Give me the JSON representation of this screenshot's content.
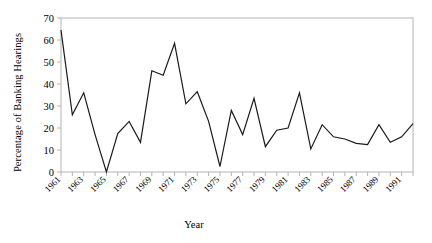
{
  "chart_data": {
    "type": "line",
    "title": "",
    "xlabel": "Year",
    "ylabel": "Percentage of Banking Hearings",
    "xlim": [
      1961,
      1992
    ],
    "ylim": [
      0,
      70
    ],
    "ytick_values": [
      0,
      10,
      20,
      30,
      40,
      50,
      60,
      70
    ],
    "ytick_labels": [
      "0",
      "10",
      "20",
      "30",
      "40",
      "50",
      "60",
      "70"
    ],
    "xtick_labels": [
      "1961",
      "1963",
      "1965",
      "1967",
      "1969",
      "1971",
      "1973",
      "1975",
      "1977",
      "1979",
      "1981",
      "1983",
      "1985",
      "1987",
      "1989",
      "1991"
    ],
    "xtick_label_years": [
      1961,
      1963,
      1965,
      1967,
      1969,
      1971,
      1973,
      1975,
      1977,
      1979,
      1981,
      1983,
      1985,
      1987,
      1989,
      1991
    ],
    "grid": false,
    "legend": null,
    "series": [
      {
        "name": "Percentage of Banking Hearings",
        "x": [
          1961,
          1962,
          1963,
          1964,
          1965,
          1966,
          1967,
          1968,
          1969,
          1970,
          1971,
          1972,
          1973,
          1974,
          1975,
          1976,
          1977,
          1978,
          1979,
          1980,
          1981,
          1982,
          1983,
          1984,
          1985,
          1986,
          1987,
          1988,
          1989,
          1990,
          1991,
          1992
        ],
        "values": [
          64.5,
          26,
          36,
          17,
          0,
          17.5,
          23,
          13.5,
          46,
          44,
          58.5,
          31,
          36.5,
          23,
          2.5,
          28,
          17,
          33.5,
          11.5,
          19,
          20,
          36,
          10.5,
          21.5,
          16,
          15,
          13,
          12.5,
          21.5,
          13.5,
          16,
          22
        ]
      }
    ],
    "line_color": "#1a1a1a",
    "line_width": 1.2,
    "axis_color": "#b4b4b4",
    "background": "#ffffff"
  }
}
